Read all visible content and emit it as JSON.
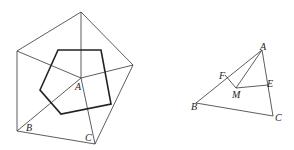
{
  "figure_left": {
    "labels": {
      "A": "A",
      "B": "B",
      "C": "C"
    },
    "outer_pentagon": [
      [
        81,
        12
      ],
      [
        133,
        65
      ],
      [
        95,
        144
      ],
      [
        17,
        131
      ],
      [
        17,
        51
      ]
    ],
    "inner_pentagon": [
      [
        58,
        50
      ],
      [
        101,
        50
      ],
      [
        111,
        104
      ],
      [
        61,
        114
      ],
      [
        40,
        90
      ]
    ],
    "center": [
      81,
      78
    ],
    "line_color": "#333333",
    "inner_color": "#222222"
  },
  "figure_right": {
    "labels": {
      "A": "A",
      "B": "B",
      "C": "C",
      "E": "E",
      "F": "F",
      "M": "M"
    },
    "points": {
      "A": [
        262,
        50
      ],
      "B": [
        196,
        103
      ],
      "C": [
        273,
        116
      ],
      "F": [
        225,
        75
      ],
      "M": [
        236,
        88
      ],
      "E": [
        268,
        85
      ]
    }
  }
}
